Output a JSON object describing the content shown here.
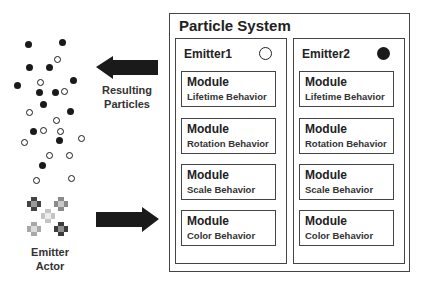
{
  "particles": {
    "filled": [
      [
        28,
        44
      ],
      [
        62,
        42
      ],
      [
        29,
        67
      ],
      [
        49,
        67
      ],
      [
        17,
        85
      ],
      [
        73,
        80
      ],
      [
        39,
        92
      ],
      [
        55,
        92
      ],
      [
        43,
        104
      ],
      [
        70,
        111
      ],
      [
        33,
        131
      ],
      [
        59,
        140
      ],
      [
        42,
        165
      ]
    ],
    "hollow": [
      [
        57,
        59
      ],
      [
        40,
        82
      ],
      [
        64,
        91
      ],
      [
        29,
        112
      ],
      [
        56,
        120
      ],
      [
        43,
        130
      ],
      [
        60,
        131
      ],
      [
        24,
        142
      ],
      [
        81,
        138
      ],
      [
        49,
        155
      ],
      [
        69,
        155
      ],
      [
        36,
        180
      ],
      [
        71,
        178
      ]
    ]
  },
  "labels": {
    "resulting_line1": "Resulting",
    "resulting_line2": "Particles",
    "emitter_actor_line1": "Emitter",
    "emitter_actor_line2": "Actor"
  },
  "arrows": {
    "output_arrow": {
      "direction": "left",
      "color": "#1a1a1a"
    },
    "input_arrow": {
      "direction": "right",
      "color": "#1a1a1a"
    }
  },
  "emitter_actor_sprites": [
    {
      "x": 34,
      "y": 204,
      "color": "#444444",
      "core": "#9a9a9a"
    },
    {
      "x": 61,
      "y": 204,
      "color": "#8a8a8a",
      "core": "#c8c8c8"
    },
    {
      "x": 48,
      "y": 216,
      "color": "#c4c4c4",
      "core": "#ececec"
    },
    {
      "x": 34,
      "y": 229,
      "color": "#a8a8a8",
      "core": "#dcdcdc"
    },
    {
      "x": 61,
      "y": 229,
      "color": "#3c3c3c",
      "core": "#909090"
    }
  ],
  "particle_system": {
    "title": "Particle System",
    "emitters": [
      {
        "name": "Emitter1",
        "indicator": "hollow",
        "modules": [
          {
            "title": "Module",
            "behavior": "Lifetime Behavior"
          },
          {
            "title": "Module",
            "behavior": "Rotation Behavior"
          },
          {
            "title": "Module",
            "behavior": "Scale Behavior"
          },
          {
            "title": "Module",
            "behavior": "Color Behavior"
          }
        ]
      },
      {
        "name": "Emitter2",
        "indicator": "filled",
        "modules": [
          {
            "title": "Module",
            "behavior": "Lifetime Behavior"
          },
          {
            "title": "Module",
            "behavior": "Rotation Behavior"
          },
          {
            "title": "Module",
            "behavior": "Scale Behavior"
          },
          {
            "title": "Module",
            "behavior": "Color Behavior"
          }
        ]
      }
    ]
  }
}
